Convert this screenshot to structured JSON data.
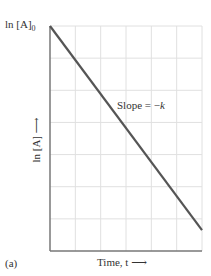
{
  "chart_data": {
    "type": "line",
    "title": "",
    "panel_label": "(a)",
    "xlabel": "Time, t",
    "xlabel_arrow": "⟶",
    "ylabel": "ln [A]",
    "ylabel_arrow": "⟶",
    "y_intercept_label": "ln [A]",
    "y_intercept_sub": "0",
    "annotation": {
      "text": "Slope = −",
      "var": "k"
    },
    "grid": true,
    "xlim": [
      0,
      6
    ],
    "ylim": [
      0,
      7
    ],
    "x_gridlines": 6,
    "y_gridlines": 7,
    "series": [
      {
        "name": "ln [A] vs t",
        "x": [
          0,
          6
        ],
        "y": [
          7,
          0.65
        ],
        "color": "#555555"
      }
    ]
  },
  "colors": {
    "line": "#555555",
    "axis": "#777777",
    "grid": "#e0e0e0"
  }
}
